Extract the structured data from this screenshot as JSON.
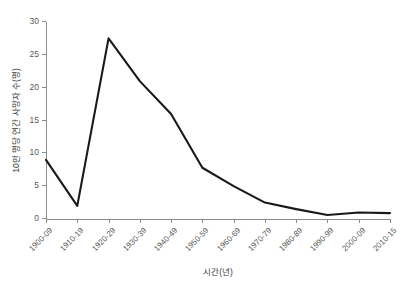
{
  "chart_data": {
    "type": "line",
    "title": "",
    "xlabel": "시간(년)",
    "ylabel": "10만 명당 연간 사망자 수(명)",
    "categories": [
      "1900-09",
      "1910-19",
      "1920-29",
      "1930-39",
      "1940-49",
      "1950-59",
      "1960-69",
      "1970-79",
      "1980-89",
      "1990-99",
      "2000-09",
      "2010-15"
    ],
    "values": [
      9.0,
      2.0,
      27.5,
      21.0,
      16.0,
      7.8,
      5.0,
      2.5,
      1.5,
      0.6,
      1.0,
      0.9
    ],
    "series": [
      {
        "name": "10만 명당 연간 사망자 수",
        "values": [
          9.0,
          2.0,
          27.5,
          21.0,
          16.0,
          7.8,
          5.0,
          2.5,
          1.5,
          0.6,
          1.0,
          0.9
        ]
      }
    ],
    "ylim": [
      0,
      30
    ],
    "yticks": [
      0,
      5,
      10,
      15,
      20,
      25,
      30
    ],
    "ytick_labels": [
      "0",
      "5",
      "10",
      "15",
      "20",
      "25",
      "30"
    ],
    "grid": false,
    "legend": "none",
    "line_color": "#1a1a1a",
    "axis_color": "#8c8c8c",
    "background": "#ffffff"
  }
}
